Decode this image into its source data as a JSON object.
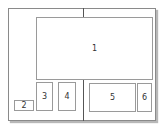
{
  "diagram": {
    "type": "page-spread-layout",
    "regions": [
      {
        "id": "1",
        "label": "1"
      },
      {
        "id": "2",
        "label": "2"
      },
      {
        "id": "3",
        "label": "3"
      },
      {
        "id": "4",
        "label": "4"
      },
      {
        "id": "5",
        "label": "5"
      },
      {
        "id": "6",
        "label": "6"
      }
    ]
  },
  "colors": {
    "border": "#8a8a8a",
    "spine": "#555555",
    "box_border": "#9a9a9a",
    "text": "#333333"
  }
}
